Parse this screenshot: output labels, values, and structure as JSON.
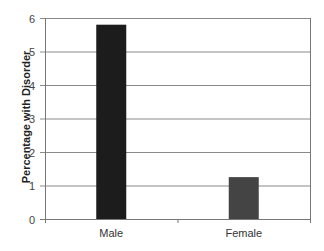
{
  "chart_data": {
    "type": "bar",
    "title": "",
    "xlabel": "",
    "ylabel": "Percentage with Disorder",
    "categories": [
      "Male",
      "Female"
    ],
    "values": [
      5.8,
      1.25
    ],
    "ylim": [
      0,
      6
    ],
    "yticks": [
      0,
      1,
      2,
      3,
      4,
      5,
      6
    ],
    "grid": true,
    "legend": null,
    "colors": [
      "#1c1c1c",
      "#444444"
    ]
  }
}
